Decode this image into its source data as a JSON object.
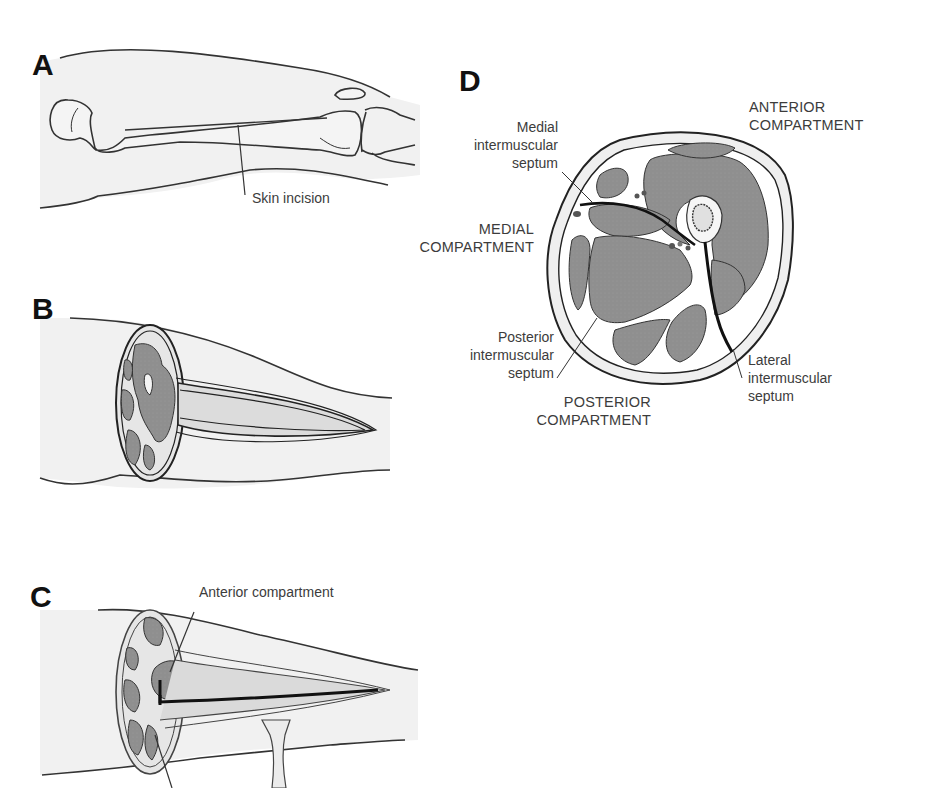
{
  "figure": {
    "panels": [
      {
        "letter": "A",
        "labels": [
          "Skin incision"
        ]
      },
      {
        "letter": "B",
        "labels": []
      },
      {
        "letter": "C",
        "labels": [
          "Anterior compartment"
        ]
      },
      {
        "letter": "D",
        "labels": [
          "Medial",
          "intermuscular",
          "septum",
          "ANTERIOR",
          "COMPARTMENT",
          "MEDIAL",
          "COMPARTMENT",
          "Posterior",
          "intermuscular",
          "septum",
          "Lateral",
          "intermuscular",
          "septum",
          "POSTERIOR",
          "COMPARTMENT"
        ]
      }
    ]
  },
  "panelA": {
    "letter": "A",
    "skin_incision": "Skin incision"
  },
  "panelB": {
    "letter": "B"
  },
  "panelC": {
    "letter": "C",
    "anterior_compartment": "Anterior compartment"
  },
  "panelD": {
    "letter": "D",
    "medial_septum": {
      "l1": "Medial",
      "l2": "intermuscular",
      "l3": "septum"
    },
    "anterior": {
      "l1": "ANTERIOR",
      "l2": "COMPARTMENT"
    },
    "medial": {
      "l1": "MEDIAL",
      "l2": "COMPARTMENT"
    },
    "posterior_septum": {
      "l1": "Posterior",
      "l2": "intermuscular",
      "l3": "septum"
    },
    "lateral_septum": {
      "l1": "Lateral",
      "l2": "intermuscular",
      "l3": "septum"
    },
    "posterior": {
      "l1": "POSTERIOR",
      "l2": "COMPARTMENT"
    }
  },
  "colors": {
    "muscle": "#8f8f8f",
    "skin_fill": "#f0f0f0",
    "outline": "#2a2a2a",
    "septum": "#111111"
  }
}
